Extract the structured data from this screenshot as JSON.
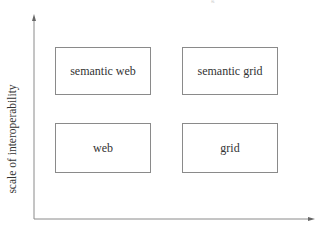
{
  "diagram": {
    "type": "quadrant",
    "y_axis_label": "scale of interoperability",
    "x_axis_label": "",
    "top_fragment": "g",
    "quadrants": [
      {
        "label": "semantic web",
        "row": "top",
        "col": "left"
      },
      {
        "label": "semantic grid",
        "row": "top",
        "col": "right"
      },
      {
        "label": "web",
        "row": "bottom",
        "col": "left"
      },
      {
        "label": "grid",
        "row": "bottom",
        "col": "right"
      }
    ]
  },
  "colors": {
    "axis": "#8a8a8a",
    "box_border": "#8a8a8a",
    "text": "#333333",
    "background": "#ffffff"
  }
}
